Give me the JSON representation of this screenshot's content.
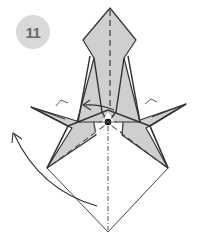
{
  "step": {
    "number": "11",
    "badge_color": "#d9d9d9",
    "number_color": "#6a6a6a"
  },
  "diagram": {
    "paper_color_colored": "#cfcfcf",
    "paper_color_white": "#ffffff",
    "line_color": "#333333",
    "elements": [
      "valley-fold-line-vertical",
      "mountain-fold-line-vertical",
      "valley-fold-lines-diagonal",
      "fold-arrow-left",
      "turn-over-curved-arrow",
      "center-reference-dot",
      "right-angle-marks"
    ]
  }
}
